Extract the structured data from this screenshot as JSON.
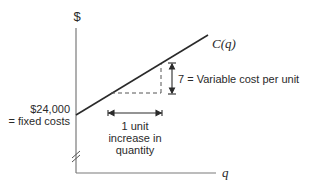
{
  "diagram": {
    "y_axis_label": "$",
    "x_axis_label": "q",
    "curve_label": "C(q)",
    "intercept_label": {
      "line1": "$24,000",
      "line2": "= fixed costs"
    },
    "slope_label": "7 = Variable cost per unit",
    "run_label": {
      "line1": "1 unit",
      "line2": "increase in",
      "line3": "quantity"
    },
    "colors": {
      "axis": "#7a7a7a",
      "line": "#2a2a2a",
      "text": "#2a2a2a"
    },
    "values": {
      "fixed_cost": 24000,
      "variable_cost_per_unit": 7
    }
  }
}
